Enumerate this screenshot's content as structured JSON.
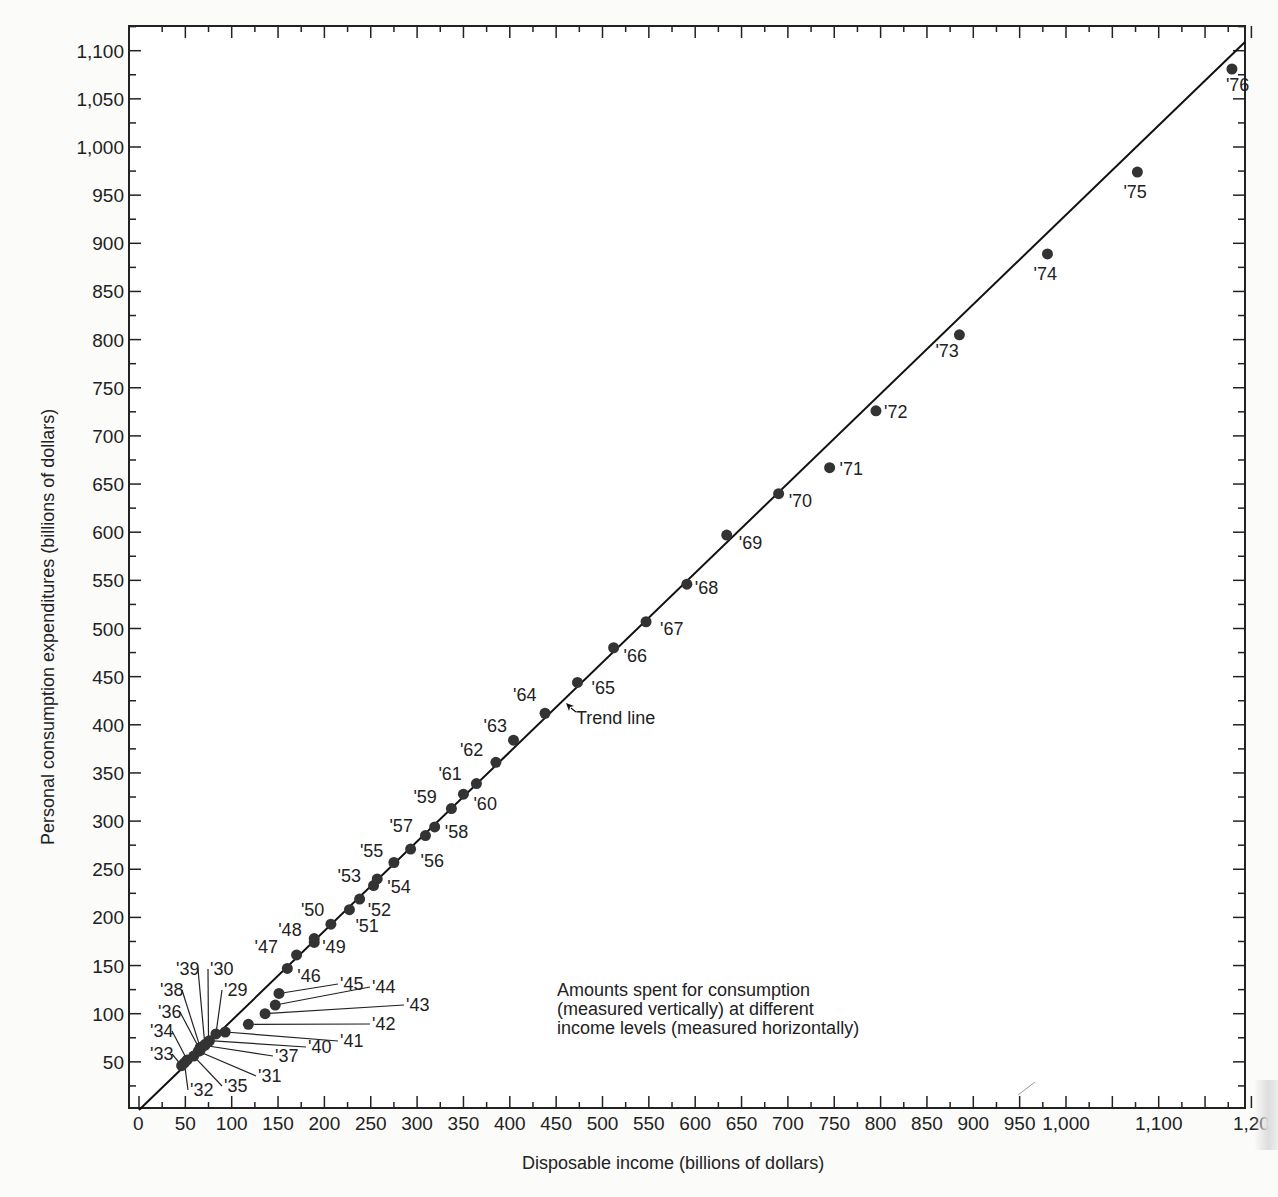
{
  "chart_data": {
    "type": "scatter",
    "title": "",
    "xlabel": "Disposable income (billions of dollars)",
    "ylabel": "Personal consumption expenditures (billions of dollars)",
    "xlim": [
      0,
      1200
    ],
    "ylim": [
      0,
      1120
    ],
    "grid": false,
    "legend": null,
    "x_ticks": [
      "0",
      "50",
      "100",
      "150",
      "200",
      "250",
      "300",
      "350",
      "400",
      "450",
      "500",
      "550",
      "600",
      "650",
      "700",
      "750",
      "800",
      "850",
      "900",
      "950",
      "1,000",
      "1,100",
      "1,20"
    ],
    "x_tick_values": [
      0,
      50,
      100,
      150,
      200,
      250,
      300,
      350,
      400,
      450,
      500,
      550,
      600,
      650,
      700,
      750,
      800,
      850,
      900,
      950,
      1000,
      1100,
      1200
    ],
    "y_ticks": [
      "50",
      "100",
      "150",
      "200",
      "250",
      "300",
      "350",
      "400",
      "450",
      "500",
      "550",
      "600",
      "650",
      "700",
      "750",
      "800",
      "850",
      "900",
      "950",
      "1,000",
      "1,050",
      "1,100"
    ],
    "y_tick_values": [
      50,
      100,
      150,
      200,
      250,
      300,
      350,
      400,
      450,
      500,
      550,
      600,
      650,
      700,
      750,
      800,
      850,
      900,
      950,
      1000,
      1050,
      1100
    ],
    "trend_line": {
      "label": "Trend line",
      "from": [
        0,
        0
      ],
      "to": [
        1200,
        1120
      ]
    },
    "annotation": [
      "Amounts spent for consumption",
      "(measured vertically) at different",
      "income levels (measured horizontally)"
    ],
    "series": [
      {
        "name": "Consumption vs. disposable income by year",
        "points": [
          {
            "label": "'29",
            "x": 83,
            "y": 79
          },
          {
            "label": "'30",
            "x": 75,
            "y": 71
          },
          {
            "label": "'31",
            "x": 64,
            "y": 61
          },
          {
            "label": "'32",
            "x": 49,
            "y": 49
          },
          {
            "label": "'33",
            "x": 46,
            "y": 46
          },
          {
            "label": "'34",
            "x": 52,
            "y": 52
          },
          {
            "label": "'35",
            "x": 59,
            "y": 56
          },
          {
            "label": "'36",
            "x": 66,
            "y": 62
          },
          {
            "label": "'37",
            "x": 71,
            "y": 67
          },
          {
            "label": "'38",
            "x": 66,
            "y": 65
          },
          {
            "label": "'39",
            "x": 71,
            "y": 68
          },
          {
            "label": "'40",
            "x": 76,
            "y": 72
          },
          {
            "label": "'41",
            "x": 93,
            "y": 81
          },
          {
            "label": "'42",
            "x": 118,
            "y": 89
          },
          {
            "label": "'43",
            "x": 136,
            "y": 100
          },
          {
            "label": "'44",
            "x": 147,
            "y": 109
          },
          {
            "label": "'45",
            "x": 151,
            "y": 121
          },
          {
            "label": "'46",
            "x": 160,
            "y": 147
          },
          {
            "label": "'47",
            "x": 170,
            "y": 161
          },
          {
            "label": "'48",
            "x": 189,
            "y": 174
          },
          {
            "label": "'49",
            "x": 189,
            "y": 178
          },
          {
            "label": "'50",
            "x": 207,
            "y": 193
          },
          {
            "label": "'51",
            "x": 227,
            "y": 208
          },
          {
            "label": "'52",
            "x": 238,
            "y": 219
          },
          {
            "label": "'53",
            "x": 253,
            "y": 233
          },
          {
            "label": "'54",
            "x": 257,
            "y": 240
          },
          {
            "label": "'55",
            "x": 275,
            "y": 257
          },
          {
            "label": "'56",
            "x": 293,
            "y": 271
          },
          {
            "label": "'57",
            "x": 309,
            "y": 285
          },
          {
            "label": "'58",
            "x": 319,
            "y": 294
          },
          {
            "label": "'59",
            "x": 337,
            "y": 313
          },
          {
            "label": "'60",
            "x": 350,
            "y": 328
          },
          {
            "label": "'61",
            "x": 364,
            "y": 339
          },
          {
            "label": "'62",
            "x": 385,
            "y": 361
          },
          {
            "label": "'63",
            "x": 404,
            "y": 384
          },
          {
            "label": "'64",
            "x": 438,
            "y": 412
          },
          {
            "label": "'65",
            "x": 473,
            "y": 444
          },
          {
            "label": "'66",
            "x": 512,
            "y": 480
          },
          {
            "label": "'67",
            "x": 547,
            "y": 507
          },
          {
            "label": "'68",
            "x": 591,
            "y": 546
          },
          {
            "label": "'69",
            "x": 634,
            "y": 597
          },
          {
            "label": "'70",
            "x": 690,
            "y": 640
          },
          {
            "label": "'71",
            "x": 745,
            "y": 667
          },
          {
            "label": "'72",
            "x": 795,
            "y": 726
          },
          {
            "label": "'73",
            "x": 885,
            "y": 805
          },
          {
            "label": "'74",
            "x": 980,
            "y": 889
          },
          {
            "label": "'75",
            "x": 1077,
            "y": 974
          },
          {
            "label": "'76",
            "x": 1179,
            "y": 1081
          }
        ]
      }
    ]
  },
  "labels": {
    "xlabel": "Disposable income (billions of dollars)",
    "ylabel": "Personal consumption expenditures (billions of dollars)",
    "trend_line": "Trend line",
    "note_line1": "Amounts spent for consumption",
    "note_line2": "(measured vertically) at different",
    "note_line3": "income levels (measured horizontally)"
  }
}
